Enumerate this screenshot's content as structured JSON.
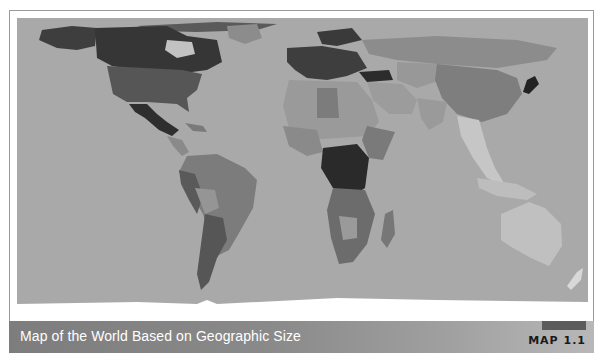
{
  "figure": {
    "caption": "Map of the World Based on Geographic Size",
    "tag": "MAP 1.1"
  },
  "map": {
    "projection": "equirectangular world map",
    "shading": "grayscale choropleth",
    "colors": {
      "ocean": "#a9a9a9",
      "frame_border": "#9a9a9a",
      "caption_bar": "#7d7d7d",
      "caption_text": "#ffffff",
      "tag_text": "#1a1a1a"
    },
    "regions": [
      {
        "name": "Canada",
        "shade": "#3a3a3a"
      },
      {
        "name": "United States",
        "shade": "#555555"
      },
      {
        "name": "Mexico",
        "shade": "#2e2e2e"
      },
      {
        "name": "Greenland",
        "shade": "#b5b5b5"
      },
      {
        "name": "South America",
        "shade": "#7a7a7a"
      },
      {
        "name": "Argentina",
        "shade": "#5a5a5a"
      },
      {
        "name": "Europe",
        "shade": "#3c3c3c"
      },
      {
        "name": "Turkey",
        "shade": "#2c2c2c"
      },
      {
        "name": "Russia",
        "shade": "#8e8e8e"
      },
      {
        "name": "China",
        "shade": "#7e7e7e"
      },
      {
        "name": "Japan",
        "shade": "#222222"
      },
      {
        "name": "North Africa",
        "shade": "#9a9a9a"
      },
      {
        "name": "Central Africa",
        "shade": "#2a2a2a"
      },
      {
        "name": "Southern Africa",
        "shade": "#6c6c6c"
      },
      {
        "name": "Madagascar",
        "shade": "#777777"
      },
      {
        "name": "Southeast Asia",
        "shade": "#c4c4c4"
      },
      {
        "name": "Australia",
        "shade": "#c0c0c0"
      },
      {
        "name": "New Zealand",
        "shade": "#d8d8d8"
      },
      {
        "name": "Antarctica",
        "shade": "#ffffff"
      }
    ]
  }
}
